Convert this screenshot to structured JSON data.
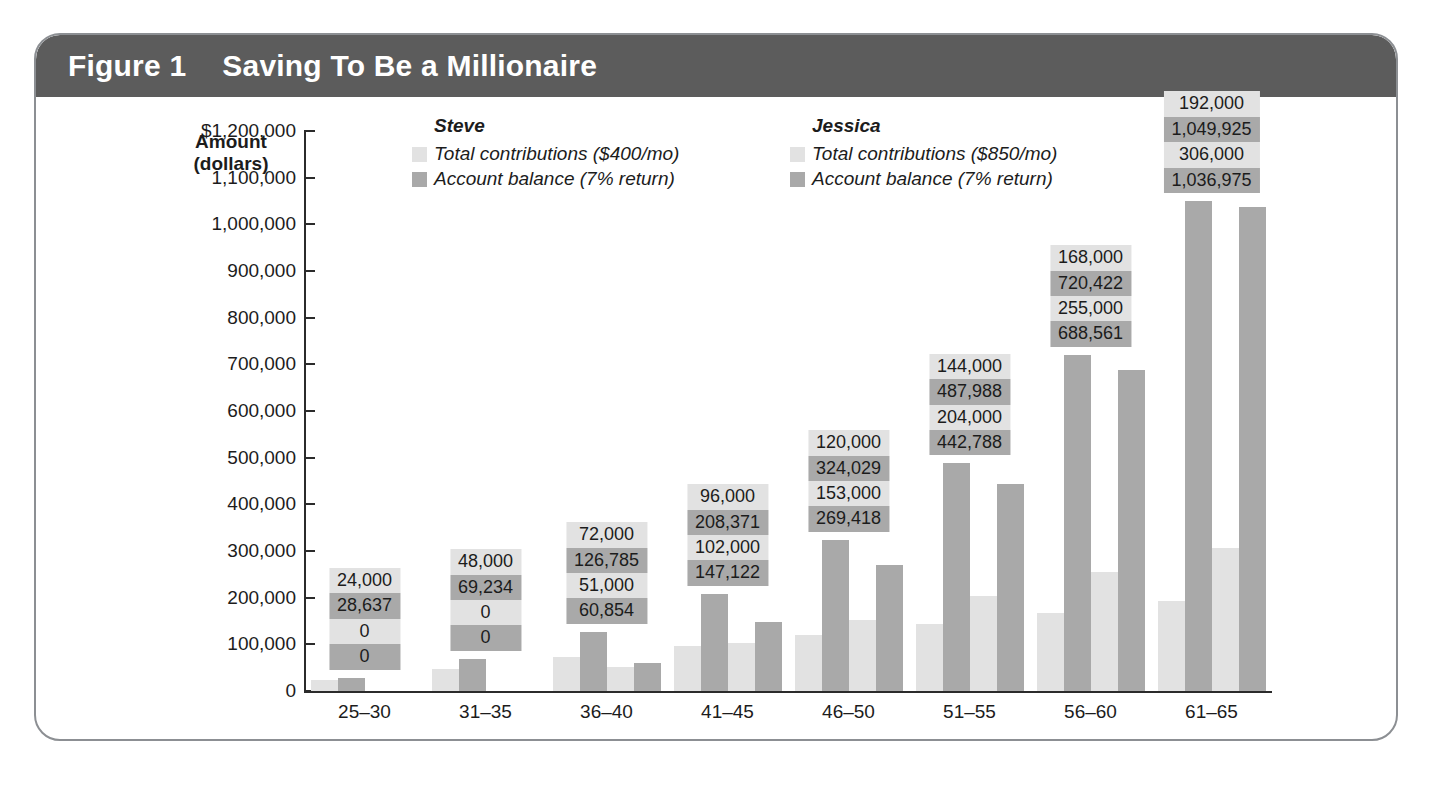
{
  "figure": {
    "number": "Figure 1",
    "title": "Saving To Be a Millionaire",
    "header_bg": "#5c5c5c",
    "header_text_color": "#ffffff",
    "border_color": "#8c8f93"
  },
  "colors": {
    "light_bar": "#e2e2e2",
    "dark_bar": "#a9a9a9",
    "axis": "#2b2b2b",
    "text": "#1c1c1c"
  },
  "legend": {
    "groups": [
      {
        "person": "Steve",
        "entries": [
          {
            "label": "Total contributions ($400/mo)",
            "color": "#e2e2e2"
          },
          {
            "label": "Account balance (7% return)",
            "color": "#a9a9a9"
          }
        ]
      },
      {
        "person": "Jessica",
        "entries": [
          {
            "label": "Total contributions ($850/mo)",
            "color": "#e2e2e2"
          },
          {
            "label": "Account balance (7% return)",
            "color": "#a9a9a9"
          }
        ]
      }
    ]
  },
  "chart_data": {
    "type": "bar",
    "title": "Saving To Be a Millionaire",
    "xlabel": "Age",
    "ylabel": "Amount (dollars)",
    "ylabel_lines": [
      "Amount",
      "(dollars)"
    ],
    "ylim": [
      0,
      1200000
    ],
    "ytick_labels": [
      "$1,200,000",
      "1,100,000",
      "1,000,000",
      "900,000",
      "800,000",
      "700,000",
      "600,000",
      "500,000",
      "400,000",
      "300,000",
      "200,000",
      "100,000",
      "0"
    ],
    "ytick_values": [
      1200000,
      1100000,
      1000000,
      900000,
      800000,
      700000,
      600000,
      500000,
      400000,
      300000,
      200000,
      100000,
      0
    ],
    "grid": false,
    "legend_position": "top-left-inside",
    "categories": [
      "25–30",
      "31–35",
      "36–40",
      "41–45",
      "46–50",
      "51–55",
      "56–60",
      "61–65"
    ],
    "series": [
      {
        "name": "Steve — Total contributions ($400/mo)",
        "color": "#e2e2e2",
        "values": [
          24000,
          48000,
          72000,
          96000,
          120000,
          144000,
          168000,
          192000
        ],
        "labels": [
          "24,000",
          "48,000",
          "72,000",
          "96,000",
          "120,000",
          "144,000",
          "168,000",
          "192,000"
        ]
      },
      {
        "name": "Steve — Account balance (7% return)",
        "color": "#a9a9a9",
        "values": [
          28637,
          69234,
          126785,
          208371,
          324029,
          487988,
          720422,
          1049925
        ],
        "labels": [
          "28,637",
          "69,234",
          "126,785",
          "208,371",
          "324,029",
          "487,988",
          "720,422",
          "1,049,925"
        ]
      },
      {
        "name": "Jessica — Total contributions ($850/mo)",
        "color": "#e2e2e2",
        "values": [
          0,
          0,
          51000,
          102000,
          153000,
          204000,
          255000,
          306000
        ],
        "labels": [
          "0",
          "0",
          "51,000",
          "102,000",
          "153,000",
          "204,000",
          "255,000",
          "306,000"
        ]
      },
      {
        "name": "Jessica — Account balance (7% return)",
        "color": "#a9a9a9",
        "values": [
          0,
          0,
          60854,
          147122,
          269418,
          442788,
          688561,
          1036975
        ],
        "labels": [
          "0",
          "0",
          "60,854",
          "147,122",
          "269,418",
          "442,788",
          "688,561",
          "1,036,975"
        ]
      }
    ]
  }
}
